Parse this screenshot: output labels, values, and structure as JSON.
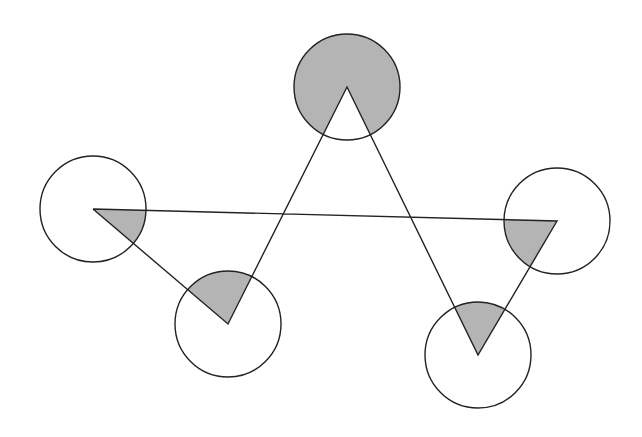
{
  "diagram": {
    "type": "star-pentagon-with-angle-sectors",
    "width": 642,
    "height": 437,
    "colors": {
      "background": "#ffffff",
      "stroke": "#222222",
      "sector_fill": "#b4b4b4"
    },
    "radius": 53,
    "vertices": [
      {
        "id": "left",
        "x": 93,
        "y": 209
      },
      {
        "id": "right",
        "x": 557,
        "y": 221
      },
      {
        "id": "bottom-right",
        "x": 478,
        "y": 355
      },
      {
        "id": "top",
        "x": 347,
        "y": 87
      },
      {
        "id": "bottom-left",
        "x": 228,
        "y": 324
      }
    ],
    "path_order": [
      "left",
      "right",
      "bottom-right",
      "top",
      "bottom-left",
      "left"
    ],
    "shaded_sectors": [
      {
        "vertex": "left",
        "description": "interior angle sector shaded"
      },
      {
        "vertex": "right",
        "description": "interior angle sector shaded"
      },
      {
        "vertex": "bottom-right",
        "description": "interior angle sector shaded"
      },
      {
        "vertex": "top",
        "description": "reflex (exterior) sector shaded"
      },
      {
        "vertex": "bottom-left",
        "description": "interior angle sector shaded"
      }
    ]
  }
}
